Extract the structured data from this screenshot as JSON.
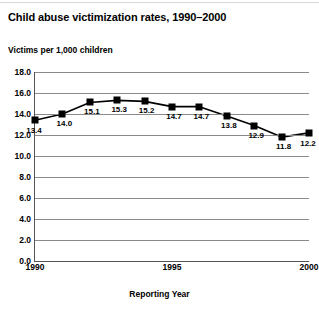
{
  "chart_data": {
    "type": "line",
    "title": "Child abuse victimization rates, 1990–2000",
    "subtitle": "Victims per 1,000 children",
    "xlabel": "Reporting Year",
    "ylabel": "",
    "x": [
      1990,
      1991,
      1992,
      1993,
      1994,
      1995,
      1996,
      1997,
      1998,
      1999,
      2000
    ],
    "values": [
      13.4,
      14.0,
      15.1,
      15.3,
      15.2,
      14.7,
      14.7,
      13.8,
      12.9,
      11.8,
      12.2
    ],
    "point_labels": [
      "13.4",
      "14.0",
      "15.1",
      "15.3",
      "15.2",
      "14.7",
      "14.7",
      "13.8",
      "12.9",
      "11.8",
      "12.2"
    ],
    "xlim": [
      1990,
      2000
    ],
    "ylim": [
      0.0,
      18.0
    ],
    "ytick_labels": [
      "18.0",
      "16.0",
      "14.0",
      "12.0",
      "10.0",
      "8.0",
      "6.0",
      "4.0",
      "2.0",
      "0.0"
    ],
    "ytick_values": [
      18.0,
      16.0,
      14.0,
      12.0,
      10.0,
      8.0,
      6.0,
      4.0,
      2.0,
      0.0
    ],
    "xtick_labels": [
      "1990",
      "1995",
      "2000"
    ],
    "xtick_values": [
      1990,
      1995,
      2000
    ],
    "grid": "horizontal",
    "legend": "none",
    "marker": "filled-square",
    "colors": {
      "line": "#000000",
      "marker": "#000000",
      "grid": "#8a8a8a",
      "axis": "#555555",
      "background": "#ffffff",
      "text": "#000000"
    }
  }
}
